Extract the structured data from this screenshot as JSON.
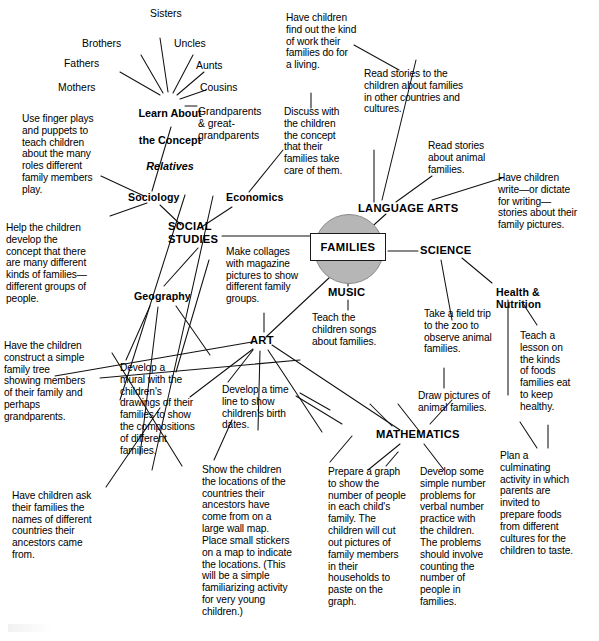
{
  "diagram": {
    "title": "FAMILIES",
    "type": "concept-web",
    "center": {
      "label": "FAMILIES"
    },
    "concept_node": {
      "line1": "Learn About",
      "line2": "the Concept",
      "line3": "Relatives"
    },
    "relative_spokes": [
      {
        "label": "Sisters"
      },
      {
        "label": "Brothers"
      },
      {
        "label": "Uncles"
      },
      {
        "label": "Fathers"
      },
      {
        "label": "Aunts"
      },
      {
        "label": "Mothers"
      },
      {
        "label": "Cousins"
      },
      {
        "label": "Grandparents\n& great-\ngrandparents"
      }
    ],
    "major_branches": [
      {
        "label": "SOCIAL\nSTUDIES"
      },
      {
        "label": "LANGUAGE ARTS"
      },
      {
        "label": "SCIENCE"
      },
      {
        "label": "MUSIC"
      },
      {
        "label": "ART"
      },
      {
        "label": "MATHEMATICS"
      }
    ],
    "sub_branches": [
      {
        "label": "Sociology"
      },
      {
        "label": "Economics"
      },
      {
        "label": "Geography"
      },
      {
        "label": "Health &\nNutrition"
      }
    ],
    "activities": [
      {
        "id": "a1",
        "text": "Use finger plays\nand puppets to\nteach children\nabout the many\nroles different\nfamily members\nplay."
      },
      {
        "id": "a2",
        "text": "Help the children\ndevelop the\nconcept that there\nare many different\nkinds of families—\ndifferent groups of\npeople."
      },
      {
        "id": "a3",
        "text": "Have the children\nconstruct a simple\nfamily tree\nshowing members\nof their family and\nperhaps\ngrandparents."
      },
      {
        "id": "a4",
        "text": "Have children ask\ntheir families the\nnames of different\ncountries their\nancestors came\nfrom."
      },
      {
        "id": "a5",
        "text": "Develop  a\nmural with the\nchildren's\ndrawings of their\nfamilies to show\nthe compositions\nof different\nfamilies."
      },
      {
        "id": "a6",
        "text": "Show the children\nthe locations of the\ncountries their\nancestors have\ncome from on a\nlarge wall map.\nPlace small stickers\non a map to indicate\nthe locations. (This\nwill be a simple\nfamiliarizing activity\nfor very young\nchildren.)"
      },
      {
        "id": "a7",
        "text": "Make collages\nwith magazine\npictures to show\ndifferent family\ngroups."
      },
      {
        "id": "a8",
        "text": "Develop a time\nline to show\nchildren's birth\ndates."
      },
      {
        "id": "a9",
        "text": "Teach the\nchildren songs\nabout families."
      },
      {
        "id": "a10",
        "text": "Have children\nfind out the kind\nof work their\nfamilies do for\na living."
      },
      {
        "id": "a11",
        "text": "Discuss with\nthe children\nthe concept\nthat their\nfamilies take\ncare of them."
      },
      {
        "id": "a12",
        "text": "Read stories to the\nchildren about families\nin other countries and\ncultures."
      },
      {
        "id": "a13",
        "text": "Read stories\nabout animal\nfamilies."
      },
      {
        "id": "a14",
        "text": "Have children\nwrite—or dictate\nfor writing—\nstories about their\nfamily pictures."
      },
      {
        "id": "a15",
        "text": "Take a field trip\nto the zoo to\nobserve animal\nfamilies."
      },
      {
        "id": "a16",
        "text": "Draw pictures of\nanimal families."
      },
      {
        "id": "a17",
        "text": "Teach a\nlesson on\nthe kinds\nof foods\nfamilies eat\nto keep\nhealthy."
      },
      {
        "id": "a18",
        "text": "Plan a\nculminating\nactivity in which\nparents are\ninvited to\nprepare foods\nfrom different\ncultures for the\nchildren to taste."
      },
      {
        "id": "a19",
        "text": "Prepare a graph\nto show the\nnumber of people\nin each child's\nfamily.  The\nchildren will cut\nout pictures of\nfamily members\nin their\nhouseholds to\npaste on the\ngraph."
      },
      {
        "id": "a20",
        "text": "Develop some\nsimple number\nproblems for\nverbal number\npractice with\nthe children.\nThe problems\nshould involve\ncounting the\nnumber of\npeople in\nfamilies."
      }
    ],
    "colors": {
      "ink": "#000000",
      "center_fill": "#b6b6b6",
      "background": "#ffffff"
    }
  }
}
